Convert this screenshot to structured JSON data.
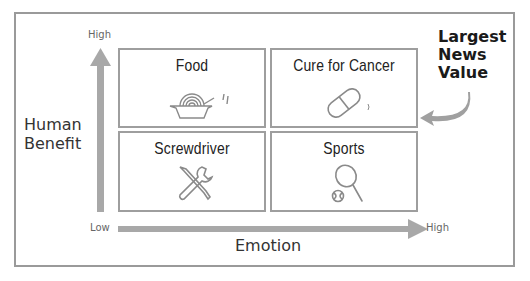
{
  "diagram": {
    "y_axis": {
      "label": "Human Benefit",
      "label_lines": [
        "Human",
        "Benefit"
      ],
      "high": "High",
      "low": "Low"
    },
    "x_axis": {
      "label": "Emotion",
      "low": "Low",
      "high": "High"
    },
    "quadrants": [
      {
        "position": "top-left",
        "title": "Food",
        "icon": "noodle-bowl-icon"
      },
      {
        "position": "top-right",
        "title": "Cure for Cancer",
        "icon": "pill-capsule-icon"
      },
      {
        "position": "bottom-left",
        "title": "Screwdriver",
        "icon": "tools-icon"
      },
      {
        "position": "bottom-right",
        "title": "Sports",
        "icon": "tennis-racket-icon"
      }
    ],
    "callout": {
      "lines": [
        "Largest",
        "News",
        "Value"
      ],
      "points_to": "Cure for Cancer"
    },
    "colors": {
      "arrow": "#a8a8a8",
      "border": "#9e9e9e",
      "text": "#222222",
      "icon": "#8a8a8a"
    }
  }
}
